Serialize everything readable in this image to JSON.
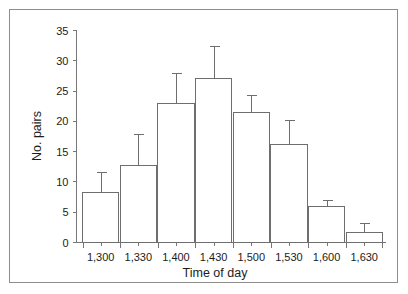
{
  "chart_data": {
    "type": "bar",
    "title": "",
    "subtitle": "",
    "xlabel": "Time of day",
    "ylabel": "No. pairs",
    "categories": [
      "1,300",
      "1,330",
      "1,400",
      "1,430",
      "1,500",
      "1,530",
      "1,600",
      "1,630"
    ],
    "values": [
      8.3,
      12.7,
      23.0,
      27.0,
      21.4,
      16.2,
      6.0,
      1.6
    ],
    "error_upper": [
      11.7,
      17.9,
      28.0,
      32.5,
      24.3,
      20.3,
      7.0,
      3.2
    ],
    "errors": [
      3.4,
      5.2,
      5.0,
      5.5,
      2.9,
      4.1,
      1.0,
      1.6
    ],
    "error_type": "upper-only",
    "ylim": [
      0,
      35
    ],
    "yticks": [
      0,
      5,
      10,
      15,
      20,
      25,
      30,
      35
    ],
    "ytick_labels": [
      "0",
      "5",
      "10",
      "15",
      "20",
      "25",
      "30",
      "35"
    ],
    "grid": false,
    "legend": null,
    "legend_position": "none",
    "bar_fill": "#ffffff",
    "bar_stroke": "#6e6e6e",
    "axis_color": "#777777",
    "frame_color": "#8d8d8d",
    "text_color": "#1c1c1c",
    "annotations": []
  },
  "figure": {
    "background": "#ffffff",
    "border_label": "figure-border"
  }
}
